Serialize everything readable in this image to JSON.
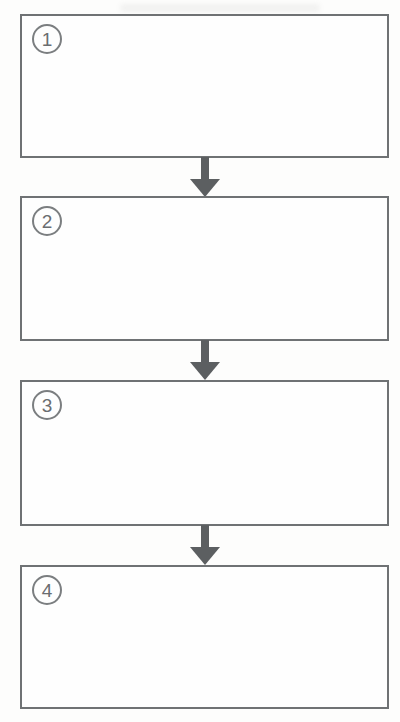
{
  "diagram": {
    "type": "flowchart",
    "direction": "top-to-bottom",
    "steps": [
      {
        "number": "1",
        "content": ""
      },
      {
        "number": "2",
        "content": ""
      },
      {
        "number": "3",
        "content": ""
      },
      {
        "number": "4",
        "content": ""
      }
    ],
    "connector": "down-arrow",
    "colors": {
      "box_border": "#6f7274",
      "circle_border": "#7b7e80",
      "number_text": "#6a6d70",
      "arrow_fill": "#5c5f61",
      "background": "#fdfdfc"
    }
  }
}
